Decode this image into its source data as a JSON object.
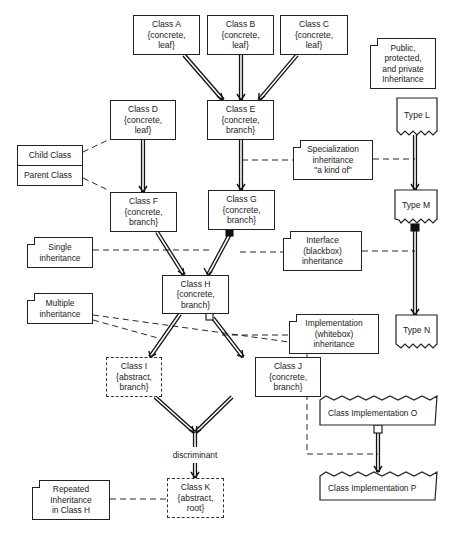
{
  "classes": {
    "a": {
      "name": "Class A",
      "props": "{concrete,",
      "kind": "leaf}"
    },
    "b": {
      "name": "Class B",
      "props": "{concrete,",
      "kind": "leaf}"
    },
    "c": {
      "name": "Class C",
      "props": "{concrete,",
      "kind": "leaf}"
    },
    "d": {
      "name": "Class D",
      "props": "{concrete,",
      "kind": "leaf}"
    },
    "e": {
      "name": "Class E",
      "props": "{concrete,",
      "kind": "branch}"
    },
    "f": {
      "name": "Class F",
      "props": "{concrete,",
      "kind": "branch}"
    },
    "g": {
      "name": "Class G",
      "props": "{concrete,",
      "kind": "branch}"
    },
    "h": {
      "name": "Class H",
      "props": "{concrete,",
      "kind": "branch}"
    },
    "i": {
      "name": "Class I",
      "props": "{abstract,",
      "kind": "branch}"
    },
    "j": {
      "name": "Class J",
      "props": "{concrete,",
      "kind": "branch}"
    },
    "k": {
      "name": "Class K",
      "props": "{abstract,",
      "kind": "root}"
    }
  },
  "types": {
    "l": "Type L",
    "m": "Type M",
    "n": "Type N"
  },
  "implementations": {
    "o": "Class Implementation O",
    "p": "Class Implementation P"
  },
  "notes": {
    "legend": {
      "top": "Child Class",
      "bottom": "Parent Class"
    },
    "visibility": [
      "Public,",
      "protected,",
      "and private",
      "Inheritance"
    ],
    "specialization": [
      "Specialization",
      "inheritance",
      "\"a kind of\""
    ],
    "single": [
      "Single",
      "inheritance"
    ],
    "interface": [
      "Interface",
      "(blackbox)",
      "inheritance"
    ],
    "multiple": [
      "Multiple",
      "inheritance"
    ],
    "implementation": [
      "Implementation",
      "(whitebox)",
      "inheritance"
    ],
    "repeated": [
      "Repeated",
      "Inheritance",
      "in Class H"
    ]
  },
  "labels": {
    "discriminant": "discriminant"
  }
}
